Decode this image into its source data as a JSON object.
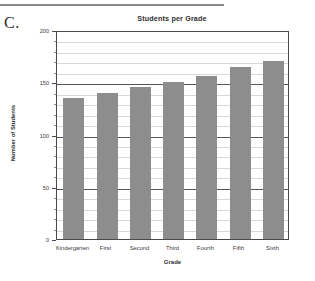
{
  "figure": {
    "label": "C."
  },
  "chart_data": {
    "type": "bar",
    "title": "Students per Grade",
    "xlabel": "Grade",
    "ylabel": "Number of Students",
    "categories": [
      "Kindergarten",
      "First",
      "Second",
      "Third",
      "Fourth",
      "Fifth",
      "Sixth"
    ],
    "values": [
      135,
      140,
      145,
      150,
      156,
      165,
      170
    ],
    "ylim": [
      0,
      200
    ],
    "yticks": [
      0,
      50,
      100,
      150,
      200
    ],
    "ytick_labels": [
      "0",
      "50",
      "100",
      "150",
      "200"
    ],
    "minor_tick_interval": 10,
    "grid": true,
    "legend": null,
    "bar_color": "#8d8d8d",
    "axis_color": "#4a4a4a",
    "grid_color": "#d8d8d8"
  }
}
